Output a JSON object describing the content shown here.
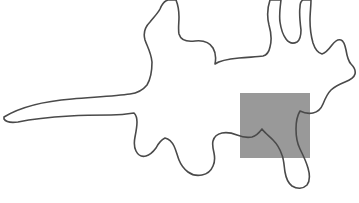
{
  "figure": {
    "kind": "line-drawing",
    "canvas": {
      "width": 359,
      "height": 203,
      "background_color": "#ffffff"
    },
    "contour": {
      "name": "animal-outline",
      "stroke_color": "#4a4a4a",
      "stroke_width": 1.6,
      "fill": "none",
      "closed": true,
      "description": "Single closed hand-drawn contour of an animal: pointed tail tapering to the far left edge, body, raised foreleg at upper left, two ears exiting the top edge of the frame, head and muzzle at the right, and legs descending toward the bottom.",
      "path_d": "M 4 117 C 22 106 46 101 72 99 C 96 97 116 96 130 94 C 138 93 143 90 147 85 C 150 80 152 72 152 62 C 151 52 147 46 145 40 C 143 33 145 27 150 22 C 154 17 158 13 160 9 C 162 4 164 1 168 0 L 176 0 C 178 5 179 11 179 17 C 179 23 178 29 179 34 C 181 41 187 42 195 41 C 204 40 210 43 213 48 C 216 53 216 59 215 64 C 219 61 228 59 239 58 C 249 57 257 57 263 56 C 267 55 269 52 270 47 C 272 40 271 32 269 25 C 267 17 267 9 270 0 L 281 0 C 280 8 279 15 280 22 C 281 29 283 35 286 39 C 289 43 293 44 297 42 C 300 40 301 36 301 30 C 300 22 299 14 300 7 C 300 3 301 1 303 0 L 311 0 C 311 6 310 13 310 20 C 310 28 311 36 313 43 C 315 49 318 53 322 54 C 326 53 329 49 332 45 C 335 41 338 39 341 40 C 344 41 345 45 346 50 C 347 56 348 61 351 64 C 354 67 356 70 355 74 C 354 78 350 80 345 82 C 340 84 335 86 331 90 C 327 94 325 99 323 104 C 321 109 318 112 313 113 C 308 114 304 113 300 111 C 297 116 296 122 296 129 C 296 136 297 143 300 149 C 303 155 306 161 308 168 C 310 175 310 181 307 185 C 303 189 297 189 292 186 C 288 183 286 178 285 172 C 284 166 284 160 282 155 C 280 149 277 144 273 140 C 269 136 265 133 262 129 C 259 133 256 136 252 137 C 247 138 242 137 237 135 C 232 133 227 132 222 133 C 217 134 214 137 213 141 C 212 145 213 149 214 153 C 215 158 215 162 213 166 C 211 171 207 174 202 175 C 197 176 192 175 188 172 C 184 169 181 165 179 160 C 177 155 176 150 174 146 C 172 142 169 139 165 138 C 161 140 158 144 156 148 C 153 152 150 155 146 156 C 142 157 138 155 136 151 C 134 147 134 142 135 137 C 136 132 137 127 137 122 C 137 118 136 115 134 113 C 128 114 120 115 111 115 C 99 115 85 115 70 116 C 52 117 32 119 18 122 C 11 123 6 122 4 119 Z"
    },
    "occluder": {
      "name": "gray-occluding-patch",
      "shape": "rectangle",
      "fill_color": "#999999",
      "x": 240,
      "y": 93,
      "width": 70,
      "height": 65,
      "opacity": 1,
      "description": "Opaque mid-gray square patch covering the hindquarters region of the outline; the contour strokes are drawn on top of it."
    }
  }
}
